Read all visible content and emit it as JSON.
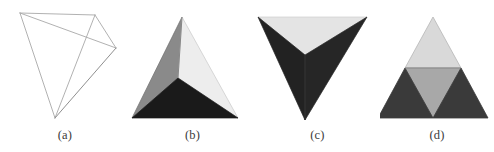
{
  "figure": {
    "type": "tetrahedron-subdivision-illustration",
    "background_color": "#ffffff",
    "panel_count": 4,
    "panels": [
      {
        "id": "a",
        "caption": "(a)",
        "style": "wireframe",
        "description": "wireframe tetrahedron drawn with thin gray edges",
        "line_color": "#a8a8a8",
        "line_color_dark": "#808080",
        "line_width": 0.9,
        "vertices": {
          "v0": [
            20,
            13
          ],
          "v1": [
            95,
            15
          ],
          "v2": [
            116,
            48
          ],
          "v3": [
            55,
            118
          ]
        },
        "edges": [
          [
            "v0",
            "v1"
          ],
          [
            "v0",
            "v2"
          ],
          [
            "v0",
            "v3"
          ],
          [
            "v1",
            "v2"
          ],
          [
            "v1",
            "v3"
          ],
          [
            "v2",
            "v3"
          ]
        ]
      },
      {
        "id": "b",
        "caption": "(b)",
        "style": "shaded-solid",
        "description": "shaded tetrahedron, apex up, three visible faces",
        "vertices": {
          "apex": [
            182,
            17
          ],
          "left": [
            132,
            118
          ],
          "right": [
            238,
            118
          ],
          "inner": [
            178,
            78
          ]
        },
        "faces": [
          {
            "name": "left-face",
            "color": "#8a8a8a",
            "points": "apex,left,inner"
          },
          {
            "name": "right-face",
            "color": "#ededed",
            "points": "apex,inner,right"
          },
          {
            "name": "bottom-face",
            "color": "#1a1a1a",
            "points": "left,inner,right"
          }
        ],
        "edge_color": "#5a5a5a"
      },
      {
        "id": "c",
        "caption": "(c)",
        "style": "shaded-solid",
        "description": "inverted shaded tetrahedron, apex down, three visible faces",
        "vertices": {
          "top_left": [
            258,
            17
          ],
          "top_right": [
            367,
            17
          ],
          "apex": [
            305,
            120
          ],
          "inner": [
            305,
            55
          ]
        },
        "faces": [
          {
            "name": "top-face",
            "color": "#e4e4e4",
            "points": "top_left,top_right,inner"
          },
          {
            "name": "left-face",
            "color": "#222222",
            "points": "top_left,inner,apex"
          },
          {
            "name": "right-face",
            "color": "#262626",
            "points": "inner,top_right,apex"
          }
        ],
        "edge_color": "#4a4a4a"
      },
      {
        "id": "d",
        "caption": "(d)",
        "style": "subdivided-triangle",
        "description": "triangle subdivided into four sub-triangles by midpoint edges",
        "vertices": {
          "apex": [
            433,
            17
          ],
          "bottom_left": [
            378,
            118
          ],
          "bottom_right": [
            488,
            118
          ],
          "mid_left": [
            405,
            68
          ],
          "mid_right": [
            461,
            68
          ],
          "mid_bottom": [
            433,
            118
          ]
        },
        "faces": [
          {
            "name": "top-subtriangle",
            "color": "#d9d9d9",
            "points": "apex,mid_left,mid_right"
          },
          {
            "name": "middle-inverted-subtriangle",
            "color": "#a8a8a8",
            "points": "mid_left,mid_right,mid_bottom"
          },
          {
            "name": "bottom-left-subtriangle",
            "color": "#3a3a3a",
            "points": "mid_left,mid_bottom,bottom_left"
          },
          {
            "name": "bottom-right-subtriangle",
            "color": "#3a3a3a",
            "points": "mid_right,bottom_right,mid_bottom"
          }
        ],
        "edge_color": "#555555"
      }
    ]
  }
}
